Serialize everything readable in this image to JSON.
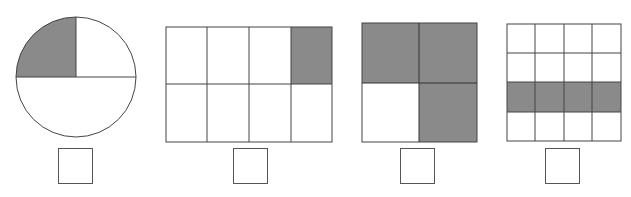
{
  "colors": {
    "shaded": "#8a8a8a",
    "line": "#444444",
    "background": "#ffffff"
  },
  "figures": [
    {
      "id": "circle",
      "shape": "circle",
      "parts": 4,
      "shaded": [
        0
      ],
      "description": "circle split into top-left quarter, top-right quarter, bottom half; top-left quarter shaded",
      "answer": ""
    },
    {
      "id": "rect-4x2",
      "shape": "rectangle",
      "cols": 4,
      "rows": 2,
      "shaded_cells": [
        [
          0,
          3
        ]
      ],
      "answer": ""
    },
    {
      "id": "square-2x2",
      "shape": "square",
      "cols": 2,
      "rows": 2,
      "shaded_cells": [
        [
          0,
          0
        ],
        [
          0,
          1
        ],
        [
          1,
          1
        ]
      ],
      "answer": ""
    },
    {
      "id": "grid-4x4",
      "shape": "square",
      "cols": 4,
      "rows": 4,
      "shaded_cells": [
        [
          2,
          0
        ],
        [
          2,
          1
        ],
        [
          2,
          2
        ],
        [
          2,
          3
        ]
      ],
      "answer": ""
    }
  ]
}
